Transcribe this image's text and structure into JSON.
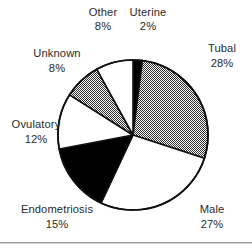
{
  "chart_data": {
    "type": "pie",
    "title": "",
    "subtitle": "",
    "xlabel": "",
    "ylabel": "",
    "legend_position": "none",
    "labels_inline": true,
    "start_angle_deg": 0,
    "direction": "clockwise",
    "categories": [
      "Uterine",
      "Tubal",
      "Male",
      "Endometriosis",
      "Ovulatory",
      "Unknown",
      "Other"
    ],
    "values": [
      2,
      28,
      27,
      15,
      12,
      8,
      8
    ],
    "value_unit": "%",
    "slices": [
      {
        "name": "Uterine",
        "value": 2,
        "label": "Uterine",
        "percent_label": "2%",
        "fill_style": "solid-black",
        "fill_color": "#000000",
        "label_x": 148,
        "label_y": 16,
        "pct_x": 148,
        "pct_y": 30
      },
      {
        "name": "Tubal",
        "value": 28,
        "label": "Tubal",
        "percent_label": "28%",
        "fill_style": "gray-stipple",
        "fill_color": "#9a9a9a",
        "label_x": 222,
        "label_y": 52,
        "pct_x": 222,
        "pct_y": 67
      },
      {
        "name": "Male",
        "value": 27,
        "label": "Male",
        "percent_label": "27%",
        "fill_style": "white",
        "fill_color": "#ffffff",
        "label_x": 212,
        "label_y": 213,
        "pct_x": 212,
        "pct_y": 228
      },
      {
        "name": "Endometriosis",
        "value": 15,
        "label": "Endometriosis",
        "percent_label": "15%",
        "fill_style": "solid-black",
        "fill_color": "#000000",
        "label_x": 57,
        "label_y": 213,
        "pct_x": 57,
        "pct_y": 228
      },
      {
        "name": "Ovulatory",
        "value": 12,
        "label": "Ovulatory",
        "percent_label": "12%",
        "fill_style": "white",
        "fill_color": "#ffffff",
        "label_x": 36,
        "label_y": 128,
        "pct_x": 36,
        "pct_y": 143
      },
      {
        "name": "Unknown",
        "value": 8,
        "label": "Unknown",
        "percent_label": "8%",
        "fill_style": "gray-stipple",
        "fill_color": "#9a9a9a",
        "label_x": 57,
        "label_y": 57,
        "pct_x": 57,
        "pct_y": 72
      },
      {
        "name": "Other",
        "value": 8,
        "label": "Other",
        "percent_label": "8%",
        "fill_style": "white",
        "fill_color": "#ffffff",
        "label_x": 103,
        "label_y": 16,
        "pct_x": 103,
        "pct_y": 30
      }
    ],
    "geometry": {
      "center_x": 133,
      "center_y": 135,
      "radius": 75
    },
    "colors": {
      "outline": "#101010",
      "text": "#2b2b2b",
      "background": "#ffffff",
      "rule": "#9a9a9a"
    }
  },
  "footer": {
    "divider_present": true
  }
}
